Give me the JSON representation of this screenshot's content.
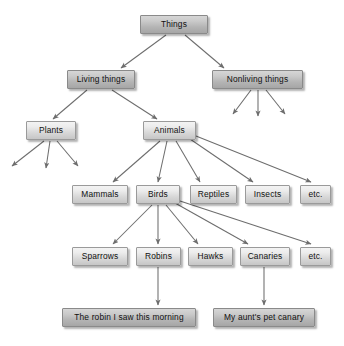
{
  "diagram": {
    "colors": {
      "box_light_top": "#f3f3f3",
      "box_light_bottom": "#c6c6c6",
      "box_dark_top": "#d6d6d6",
      "box_dark_bottom": "#a6a6a6",
      "border": "#9a9a9a",
      "arrow": "#6d6d6d",
      "text": "#101010",
      "background": "#ffffff"
    },
    "nodes": [
      {
        "id": "things",
        "label": "Things",
        "x": 140,
        "y": 15,
        "w": 68,
        "style": "dark"
      },
      {
        "id": "living",
        "label": "Living things",
        "x": 67,
        "y": 70,
        "w": 68,
        "style": "dark"
      },
      {
        "id": "nonliving",
        "label": "Nonliving things",
        "x": 212,
        "y": 70,
        "w": 91,
        "style": "dark"
      },
      {
        "id": "plants",
        "label": "Plants",
        "x": 26,
        "y": 121,
        "w": 50,
        "style": "light"
      },
      {
        "id": "animals",
        "label": "Animals",
        "x": 143,
        "y": 121,
        "w": 53,
        "style": "light"
      },
      {
        "id": "mammals",
        "label": "Mammals",
        "x": 72,
        "y": 185,
        "w": 56,
        "style": "light"
      },
      {
        "id": "birds",
        "label": "Birds",
        "x": 136,
        "y": 185,
        "w": 44,
        "style": "light"
      },
      {
        "id": "reptiles",
        "label": "Reptiles",
        "x": 190,
        "y": 185,
        "w": 47,
        "style": "light"
      },
      {
        "id": "insects",
        "label": "Insects",
        "x": 245,
        "y": 185,
        "w": 45,
        "style": "light"
      },
      {
        "id": "etc_animals",
        "label": "etc.",
        "x": 300,
        "y": 185,
        "w": 31,
        "style": "light"
      },
      {
        "id": "sparrows",
        "label": "Sparrows",
        "x": 72,
        "y": 247,
        "w": 56,
        "style": "light"
      },
      {
        "id": "robins",
        "label": "Robins",
        "x": 136,
        "y": 247,
        "w": 45,
        "style": "light"
      },
      {
        "id": "hawks",
        "label": "Hawks",
        "x": 188,
        "y": 247,
        "w": 45,
        "style": "light"
      },
      {
        "id": "canaries",
        "label": "Canaries",
        "x": 240,
        "y": 247,
        "w": 50,
        "style": "light"
      },
      {
        "id": "etc_birds",
        "label": "etc.",
        "x": 300,
        "y": 247,
        "w": 31,
        "style": "light"
      },
      {
        "id": "robin_example",
        "label": "The robin I saw this morning",
        "x": 62,
        "y": 308,
        "w": 134,
        "style": "dark"
      },
      {
        "id": "canary_example",
        "label": "My aunt's pet canary",
        "x": 213,
        "y": 308,
        "w": 102,
        "style": "dark"
      }
    ],
    "edges": [
      {
        "from": "things",
        "to": "living",
        "x1": 166,
        "y1": 35,
        "x2": 121,
        "y2": 68
      },
      {
        "from": "things",
        "to": "nonliving",
        "x1": 185,
        "y1": 35,
        "x2": 224,
        "y2": 68
      },
      {
        "from": "living",
        "to": "plants",
        "x1": 87,
        "y1": 90,
        "x2": 53,
        "y2": 119
      },
      {
        "from": "living",
        "to": "animals",
        "x1": 112,
        "y1": 90,
        "x2": 157,
        "y2": 119
      },
      {
        "from": "nonliving",
        "to": "dangling-1",
        "x1": 251,
        "y1": 90,
        "x2": 233,
        "y2": 114
      },
      {
        "from": "nonliving",
        "to": "dangling-2",
        "x1": 258,
        "y1": 90,
        "x2": 258,
        "y2": 116
      },
      {
        "from": "nonliving",
        "to": "dangling-3",
        "x1": 266,
        "y1": 90,
        "x2": 285,
        "y2": 114
      },
      {
        "from": "plants",
        "to": "dangling-4",
        "x1": 44,
        "y1": 141,
        "x2": 12,
        "y2": 166
      },
      {
        "from": "plants",
        "to": "dangling-5",
        "x1": 50,
        "y1": 141,
        "x2": 46,
        "y2": 168
      },
      {
        "from": "plants",
        "to": "dangling-6",
        "x1": 57,
        "y1": 141,
        "x2": 78,
        "y2": 166
      },
      {
        "from": "animals",
        "to": "mammals",
        "x1": 160,
        "y1": 141,
        "x2": 113,
        "y2": 182
      },
      {
        "from": "animals",
        "to": "birds",
        "x1": 167,
        "y1": 141,
        "x2": 158,
        "y2": 182
      },
      {
        "from": "animals",
        "to": "reptiles",
        "x1": 176,
        "y1": 141,
        "x2": 200,
        "y2": 182
      },
      {
        "from": "animals",
        "to": "insects",
        "x1": 190,
        "y1": 139,
        "x2": 253,
        "y2": 182
      },
      {
        "from": "animals",
        "to": "etc_animals",
        "x1": 196,
        "y1": 136,
        "x2": 311,
        "y2": 182
      },
      {
        "from": "birds",
        "to": "sparrows",
        "x1": 152,
        "y1": 205,
        "x2": 113,
        "y2": 244
      },
      {
        "from": "birds",
        "to": "robins",
        "x1": 158,
        "y1": 205,
        "x2": 158,
        "y2": 244
      },
      {
        "from": "birds",
        "to": "hawks",
        "x1": 166,
        "y1": 205,
        "x2": 198,
        "y2": 244
      },
      {
        "from": "birds",
        "to": "canaries",
        "x1": 175,
        "y1": 203,
        "x2": 248,
        "y2": 244
      },
      {
        "from": "birds",
        "to": "etc_birds",
        "x1": 180,
        "y1": 201,
        "x2": 311,
        "y2": 244
      },
      {
        "from": "robins",
        "to": "robin_example",
        "x1": 158,
        "y1": 267,
        "x2": 158,
        "y2": 305
      },
      {
        "from": "canaries",
        "to": "canary_example",
        "x1": 264,
        "y1": 267,
        "x2": 264,
        "y2": 305
      }
    ]
  }
}
